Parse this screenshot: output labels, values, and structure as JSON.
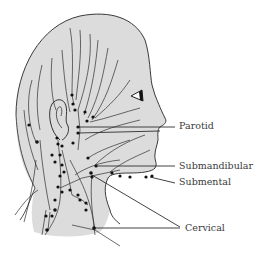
{
  "figure": {
    "colors": {
      "skin_fill": "#dcdcdc",
      "outline": "#3a3a3a",
      "vessel": "#2e2e2e",
      "node": "#111111",
      "label_text": "#3a3a3a",
      "background": "#ffffff"
    },
    "labels": [
      {
        "id": "parotid",
        "text": "Parotid",
        "x": 179,
        "y": 125
      },
      {
        "id": "submandibular",
        "text": "Submandibular",
        "x": 179,
        "y": 160
      },
      {
        "id": "submental",
        "text": "Submental",
        "x": 179,
        "y": 177
      },
      {
        "id": "cervical",
        "text": "Cervical",
        "x": 185,
        "y": 222
      }
    ]
  }
}
